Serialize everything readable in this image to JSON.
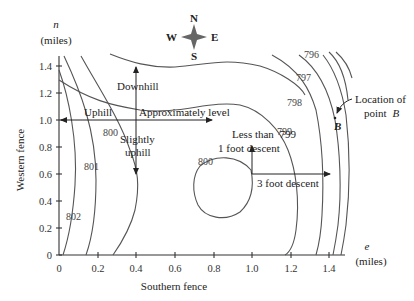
{
  "figure": {
    "y_axis": {
      "var": "n",
      "unit": "(miles)",
      "title": "Western fence",
      "ticks": [
        "0",
        "0.2",
        "0.4",
        "0.6",
        "0.8",
        "1.0",
        "1.2",
        "1.4"
      ]
    },
    "x_axis": {
      "var": "e",
      "unit": "(miles)",
      "title": "Southern fence",
      "ticks": [
        "0",
        "0.2",
        "0.4",
        "0.6",
        "0.8",
        "1.0",
        "1.2",
        "1.4"
      ]
    },
    "compass": {
      "n": "N",
      "s": "S",
      "e": "E",
      "w": "W"
    },
    "contour_labels": {
      "c802": "802",
      "c801": "801",
      "c800_left": "800",
      "c800_loop": "800",
      "c799": "799",
      "c798": "798",
      "c797": "797",
      "c796": "796"
    },
    "annotations": {
      "uphill": "Uphill",
      "downhill": "Downhill",
      "approx_level": "Approximately level",
      "slightly": "Slightly",
      "uphill2": "uphill",
      "less_than": "Less than",
      "one_foot": "1 foot descent",
      "three_foot": "3 foot descent",
      "location_of": "Location of",
      "point": "point",
      "point_name": "B",
      "b_label": "B"
    }
  }
}
